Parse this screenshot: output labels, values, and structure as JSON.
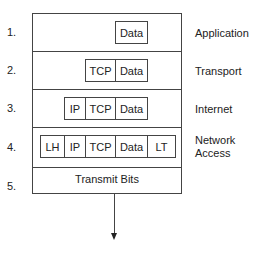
{
  "diagram": {
    "rows": [
      {
        "number": "1.",
        "layer": "Application",
        "cells": [
          "Data"
        ]
      },
      {
        "number": "2.",
        "layer": "Transport",
        "cells": [
          "TCP",
          "Data"
        ]
      },
      {
        "number": "3.",
        "layer": "Internet",
        "cells": [
          "IP",
          "TCP",
          "Data"
        ]
      },
      {
        "number": "4.",
        "layer_line1": "Network",
        "layer_line2": "Access",
        "cells": [
          "LH",
          "IP",
          "TCP",
          "Data",
          "LT"
        ]
      },
      {
        "number": "5.",
        "text": "Transmit Bits"
      }
    ],
    "colors": {
      "line": "#444444",
      "text": "#222222",
      "background": "#ffffff"
    }
  }
}
